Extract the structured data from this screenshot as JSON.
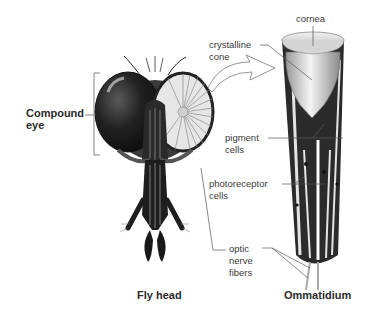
{
  "diagram": {
    "left_panel": {
      "title": "Fly head",
      "labels": {
        "compound_eye": "Compound\neye"
      }
    },
    "right_panel": {
      "title": "Ommatidium",
      "labels": {
        "cornea": "cornea",
        "crystalline_cone": "crystalline\ncone",
        "pigment_cells": "pigment\ncells",
        "photoreceptor_cells": "photoreceptor\ncells",
        "optic_nerve_fibers": "optic\nnerve\nfibers"
      }
    },
    "colors": {
      "label_text": "#3a3a3a",
      "leader_line": "#555555",
      "eye_dark": "#1c1c1c",
      "eye_facets": "#e6e6e6",
      "ommatidium_dark": "#2b2b2b",
      "cone": "#d8d8d8"
    }
  }
}
